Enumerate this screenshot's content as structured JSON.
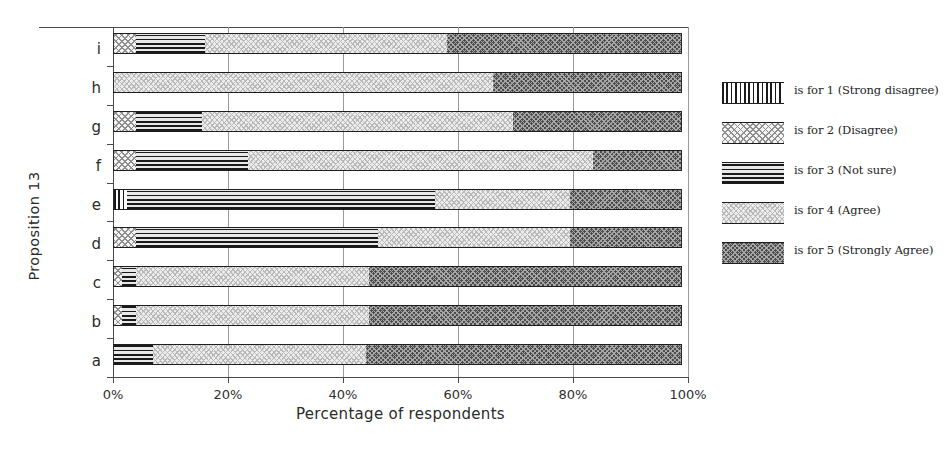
{
  "chart_data": {
    "type": "bar",
    "orientation": "horizontal",
    "stacked": true,
    "stacked_mode": "percent",
    "title": "",
    "xlabel": "Percentage of respondents",
    "ylabel": "Proposition 13",
    "xlim": [
      0,
      100
    ],
    "xticks": [
      0,
      20,
      40,
      60,
      80,
      100
    ],
    "xticklabels": [
      "0%",
      "20%",
      "40%",
      "60%",
      "80%",
      "100%"
    ],
    "grid": true,
    "grid_axis": "x",
    "legend_position": "right",
    "categories": [
      "a",
      "b",
      "c",
      "d",
      "e",
      "f",
      "g",
      "h",
      "i"
    ],
    "categories_top_to_bottom": [
      "i",
      "h",
      "g",
      "f",
      "e",
      "d",
      "c",
      "b",
      "a"
    ],
    "series": [
      {
        "name": "is for 1 (Strong disagree)",
        "key": "strong_disagree",
        "pattern": "vertical-lines",
        "values": [
          0,
          0,
          0,
          0,
          2.5,
          0,
          0,
          0,
          0
        ]
      },
      {
        "name": "is for 2 (Disagree)",
        "key": "disagree",
        "pattern": "checkerboard-light",
        "values": [
          0,
          1.5,
          1.5,
          4,
          0,
          4,
          4,
          0,
          4
        ]
      },
      {
        "name": "is for 3 (Not sure)",
        "key": "not_sure",
        "pattern": "horizontal-lines",
        "values": [
          7,
          2.5,
          2.5,
          42,
          53.5,
          19.5,
          11.5,
          0,
          12
        ]
      },
      {
        "name": "is for 4 (Agree)",
        "key": "agree",
        "pattern": "zigzag-light",
        "values": [
          37,
          40.5,
          40.5,
          33.5,
          23.5,
          60,
          54,
          66,
          42
        ]
      },
      {
        "name": "is for 5 (Strongly Agree)",
        "key": "strongly_agree",
        "pattern": "checkerboard-dark",
        "values": [
          55,
          54.5,
          54.5,
          19.5,
          19.5,
          15.5,
          29.5,
          33,
          41
        ]
      }
    ]
  },
  "legend": {
    "entries": [
      {
        "label": "is for 1 (Strong disagree)",
        "pattern": "vertical-lines"
      },
      {
        "label": "is for 2 (Disagree)",
        "pattern": "checkerboard-light"
      },
      {
        "label": "is for 3 (Not sure)",
        "pattern": "horizontal-lines"
      },
      {
        "label": "is for 4 (Agree)",
        "pattern": "zigzag-light"
      },
      {
        "label": "is for 5 (Strongly Agree)",
        "pattern": "checkerboard-dark"
      }
    ]
  },
  "colors": {
    "axis": "#4a4a4a",
    "grid": "#9a9a9a",
    "text": "#2b2b2b",
    "bar_outline": "#1e1e1e",
    "dark_fill": "#4c4c4c"
  }
}
